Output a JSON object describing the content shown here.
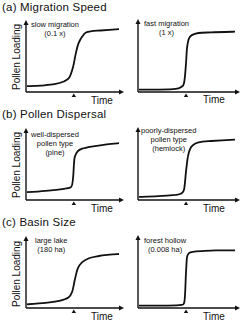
{
  "chart_data": [
    {
      "type": "line",
      "section": "(a) Migration Speed",
      "panel": "left",
      "annotation": [
        "slow migration",
        "(0.1 x)"
      ],
      "xlabel": "Time",
      "ylabel": "Pollen Loading",
      "marker_x": 0.52,
      "x": [
        0,
        0.15,
        0.3,
        0.4,
        0.46,
        0.5,
        0.53,
        0.56,
        0.6,
        0.64,
        0.7,
        0.8,
        1.0
      ],
      "y": [
        0.07,
        0.08,
        0.1,
        0.14,
        0.2,
        0.35,
        0.55,
        0.7,
        0.8,
        0.86,
        0.88,
        0.89,
        0.91
      ]
    },
    {
      "type": "line",
      "section": "(a) Migration Speed",
      "panel": "right",
      "annotation": [
        "fast migration",
        "(1 x)"
      ],
      "xlabel": "Time",
      "ylabel": "",
      "marker_x": 0.5,
      "x": [
        0,
        0.2,
        0.38,
        0.44,
        0.47,
        0.49,
        0.5,
        0.52,
        0.55,
        0.62,
        0.75,
        1.0
      ],
      "y": [
        0.02,
        0.02,
        0.03,
        0.06,
        0.12,
        0.4,
        0.62,
        0.76,
        0.81,
        0.84,
        0.85,
        0.86
      ]
    },
    {
      "type": "line",
      "section": "(b) Pollen Dispersal",
      "panel": "left",
      "annotation": [
        "well-dispersed",
        "pollen type",
        "(pine)"
      ],
      "xlabel": "Time",
      "ylabel": "Pollen Loading",
      "marker_x": 0.52,
      "x": [
        0,
        0.2,
        0.4,
        0.48,
        0.5,
        0.51,
        0.52,
        0.55,
        0.6,
        0.7,
        0.85,
        1.0
      ],
      "y": [
        0.1,
        0.12,
        0.15,
        0.18,
        0.3,
        0.5,
        0.62,
        0.7,
        0.74,
        0.77,
        0.8,
        0.82
      ]
    },
    {
      "type": "line",
      "section": "(b) Pollen Dispersal",
      "panel": "right",
      "annotation": [
        "poorly-dispersed",
        "pollen type",
        "(hemlock)"
      ],
      "xlabel": "Time",
      "ylabel": "",
      "marker_x": 0.5,
      "x": [
        0,
        0.2,
        0.38,
        0.44,
        0.47,
        0.49,
        0.51,
        0.53,
        0.56,
        0.62,
        0.75,
        1.0
      ],
      "y": [
        0.03,
        0.04,
        0.06,
        0.08,
        0.14,
        0.4,
        0.62,
        0.72,
        0.78,
        0.82,
        0.84,
        0.86
      ]
    },
    {
      "type": "line",
      "section": "(c) Basin Size",
      "panel": "left",
      "annotation": [
        "large lake",
        "(180 ha)"
      ],
      "xlabel": "Time",
      "ylabel": "Pollen Loading",
      "marker_x": 0.52,
      "x": [
        0,
        0.2,
        0.35,
        0.45,
        0.49,
        0.52,
        0.55,
        0.6,
        0.68,
        0.78,
        0.9,
        1.0
      ],
      "y": [
        0.04,
        0.06,
        0.09,
        0.14,
        0.22,
        0.4,
        0.56,
        0.66,
        0.72,
        0.75,
        0.77,
        0.78
      ]
    },
    {
      "type": "line",
      "section": "(c) Basin Size",
      "panel": "right",
      "annotation": [
        "forest hollow",
        "(0.008 ha)"
      ],
      "xlabel": "Time",
      "ylabel": "",
      "marker_x": 0.5,
      "x": [
        0,
        0.3,
        0.44,
        0.47,
        0.48,
        0.49,
        0.5,
        0.52,
        0.56,
        0.65,
        0.8,
        1.0
      ],
      "y": [
        0.02,
        0.02,
        0.03,
        0.06,
        0.2,
        0.5,
        0.72,
        0.78,
        0.8,
        0.81,
        0.82,
        0.82
      ]
    }
  ],
  "sections": [
    {
      "title": "(a) Migration Speed"
    },
    {
      "title": "(b) Pollen Dispersal"
    },
    {
      "title": "(c) Basin Size"
    }
  ],
  "axis": {
    "xlabel": "Time",
    "ylabel": "Pollen Loading"
  }
}
